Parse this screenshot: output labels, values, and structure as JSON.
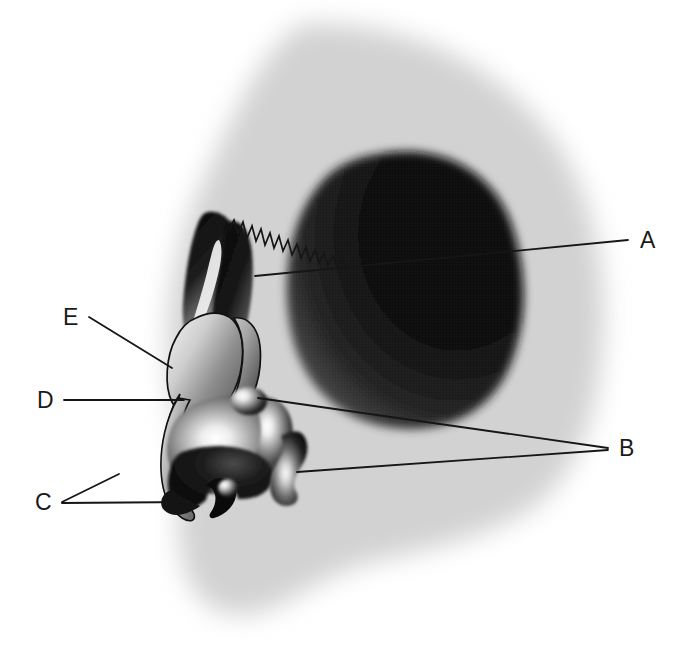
{
  "figure": {
    "type": "anatomical-illustration",
    "orientation": "profile facing left",
    "background_color": "#ffffff",
    "silhouette_color": "#d4d4d4",
    "ink_color": "#1a1a1a"
  },
  "labels": [
    {
      "id": "A",
      "text": "A",
      "x": 640,
      "y": 229,
      "leader": "horizontal line running left from the label across the large dark rounded mass to the nasal root, continuing as a jagged suture line"
    },
    {
      "id": "B",
      "text": "B",
      "x": 619,
      "y": 437,
      "leader": "two lines fanning left from the label to a small rounded nodule and to a curved bean-shaped body"
    },
    {
      "id": "C",
      "text": "C",
      "x": 35,
      "y": 491,
      "leader": "two lines fanning right from the label to the lower nasal cartilage structures"
    },
    {
      "id": "D",
      "text": "D",
      "x": 37,
      "y": 389,
      "leader": "horizontal line running right from the label to the mid nasal dorsum"
    },
    {
      "id": "E",
      "text": "E",
      "x": 63,
      "y": 306,
      "leader": "diagonal line running down-right from the label to the upper nasal dorsum"
    }
  ],
  "structures": [
    {
      "name": "cranial-silhouette",
      "description": "Soft gray blurred head profile, facing left",
      "tone": "light-gray"
    },
    {
      "name": "dark-rounded-mass",
      "description": "Large dark shaded ovoid mass in the mid-face / orbital region",
      "tone": "very-dark"
    },
    {
      "name": "suture-line",
      "description": "Jagged zig-zag line running from the nasal root toward the dark mass",
      "tone": "ink"
    },
    {
      "name": "frontal-sinus-left",
      "description": "Dark teardrop shape above the nasal root",
      "tone": "dark"
    },
    {
      "name": "frontal-sinus-right",
      "description": "Dark curved horn shape beside the teardrop",
      "tone": "dark"
    },
    {
      "name": "nasal-dorsum",
      "description": "Elongated shaded plate forming the bridge of the nose",
      "tone": "mid-gray"
    },
    {
      "name": "nasal-cartilage-body",
      "description": "Large highlighted lobed body forming the nasal tip region",
      "tone": "gradient"
    },
    {
      "name": "ala-nasi",
      "description": "Dark curved lower nasal wing with notch",
      "tone": "dark"
    },
    {
      "name": "nodule-superior",
      "description": "Small highlighted spherical nodule at the posterior nasal margin",
      "tone": "gradient"
    },
    {
      "name": "nodule-inferior",
      "description": "Small highlighted spherical nodule at the lower nasal margin",
      "tone": "gradient"
    },
    {
      "name": "bean-body",
      "description": "Curved bean-shaped detached body posterior to the nose",
      "tone": "gradient"
    }
  ]
}
